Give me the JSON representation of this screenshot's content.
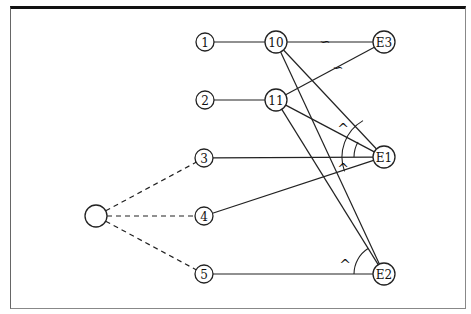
{
  "diagram": {
    "type": "graph",
    "nodes": [
      {
        "id": "src",
        "label": "",
        "x": 96,
        "y": 216,
        "r": 11
      },
      {
        "id": "n1",
        "label": "1",
        "x": 205,
        "y": 42,
        "r": 9
      },
      {
        "id": "n2",
        "label": "2",
        "x": 205,
        "y": 100,
        "r": 9
      },
      {
        "id": "n3",
        "label": "3",
        "x": 204,
        "y": 158,
        "r": 9
      },
      {
        "id": "n4",
        "label": "4",
        "x": 204,
        "y": 216,
        "r": 9
      },
      {
        "id": "n5",
        "label": "5",
        "x": 204,
        "y": 274,
        "r": 9
      },
      {
        "id": "n10",
        "label": "10",
        "x": 276,
        "y": 42,
        "r": 11
      },
      {
        "id": "n11",
        "label": "11",
        "x": 276,
        "y": 100,
        "r": 11
      },
      {
        "id": "E3",
        "label": "E3",
        "x": 384,
        "y": 42,
        "r": 11
      },
      {
        "id": "E1",
        "label": "E1",
        "x": 384,
        "y": 157,
        "r": 11
      },
      {
        "id": "E2",
        "label": "E2",
        "x": 384,
        "y": 274,
        "r": 11
      }
    ],
    "edges": [
      {
        "from": "src",
        "to": "n3",
        "style": "dashed"
      },
      {
        "from": "src",
        "to": "n4",
        "style": "dashed"
      },
      {
        "from": "src",
        "to": "n5",
        "style": "dashed"
      },
      {
        "from": "n1",
        "to": "n10",
        "style": "solid"
      },
      {
        "from": "n2",
        "to": "n11",
        "style": "solid"
      },
      {
        "from": "n10",
        "to": "E3",
        "style": "solid",
        "marker": "∽"
      },
      {
        "from": "n11",
        "to": "E3",
        "style": "solid",
        "marker": "∽"
      },
      {
        "from": "n10",
        "to": "E1",
        "style": "solid"
      },
      {
        "from": "n10",
        "to": "E2",
        "style": "solid"
      },
      {
        "from": "n11",
        "to": "E1",
        "style": "solid"
      },
      {
        "from": "n11",
        "to": "E2",
        "style": "solid"
      },
      {
        "from": "n3",
        "to": "E1",
        "style": "solid"
      },
      {
        "from": "n4",
        "to": "E1",
        "style": "solid"
      },
      {
        "from": "n5",
        "to": "E2",
        "style": "solid"
      }
    ],
    "markers": [
      {
        "symbol": "∽",
        "x": 325,
        "y": 42
      },
      {
        "symbol": "∽",
        "x": 338,
        "y": 68
      },
      {
        "symbol": "^",
        "x": 343,
        "y": 130
      },
      {
        "symbol": "^",
        "x": 343,
        "y": 170
      },
      {
        "symbol": "^",
        "x": 345,
        "y": 266
      }
    ],
    "arcs": [
      {
        "center": "E1",
        "r": 30,
        "from_deg": 180,
        "to_deg": 210
      },
      {
        "center": "E1",
        "r": 42,
        "from_deg": 160,
        "to_deg": 240
      },
      {
        "center": "E2",
        "r": 30,
        "from_deg": 180,
        "to_deg": 238
      }
    ]
  }
}
